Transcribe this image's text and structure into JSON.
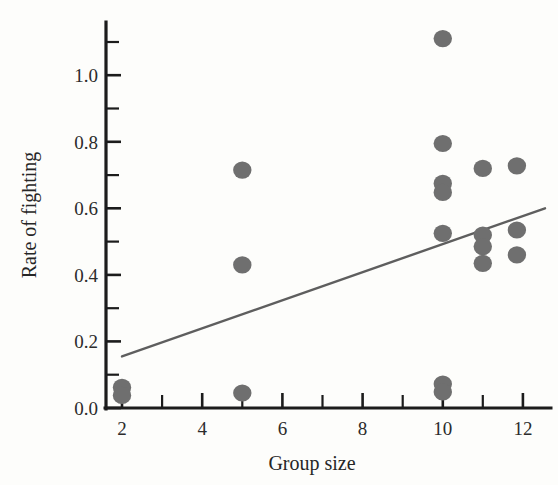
{
  "chart_data": {
    "type": "scatter",
    "title": "",
    "subtitle": "",
    "xlabel": "Group size",
    "ylabel": "Rate of fighting",
    "xlim": [
      1.6,
      12.7
    ],
    "ylim": [
      0.0,
      1.16
    ],
    "xticks": [
      2,
      4,
      6,
      8,
      10,
      12
    ],
    "xtick_labels": [
      "2",
      "4",
      "6",
      "8",
      "10",
      "12"
    ],
    "xminorticks": [
      3,
      5,
      7,
      9,
      11
    ],
    "yticks": [
      0.0,
      0.2,
      0.4,
      0.6,
      0.8,
      1.0
    ],
    "ytick_labels": [
      "0.0",
      "0.2",
      "0.4",
      "0.6",
      "0.8",
      "1.0"
    ],
    "yminorticks": [
      0.1,
      0.3,
      0.5,
      0.7,
      0.9,
      1.1
    ],
    "grid": false,
    "legend": false,
    "marker_color": "#6f6f6f",
    "axis_color": "#1c1c1c",
    "trendline_color": "#5e5e5e",
    "background": "#fdfdfb",
    "points": [
      {
        "x": 2,
        "y": 0.062
      },
      {
        "x": 2,
        "y": 0.038
      },
      {
        "x": 5,
        "y": 0.715
      },
      {
        "x": 5,
        "y": 0.43
      },
      {
        "x": 5,
        "y": 0.045
      },
      {
        "x": 10,
        "y": 1.11
      },
      {
        "x": 10,
        "y": 0.795
      },
      {
        "x": 10,
        "y": 0.675
      },
      {
        "x": 10,
        "y": 0.648
      },
      {
        "x": 10,
        "y": 0.525
      },
      {
        "x": 10,
        "y": 0.072
      },
      {
        "x": 10,
        "y": 0.048
      },
      {
        "x": 11,
        "y": 0.72
      },
      {
        "x": 11,
        "y": 0.52
      },
      {
        "x": 11,
        "y": 0.485
      },
      {
        "x": 11,
        "y": 0.435
      },
      {
        "x": 11.85,
        "y": 0.728
      },
      {
        "x": 11.85,
        "y": 0.535
      },
      {
        "x": 11.85,
        "y": 0.46
      }
    ],
    "trendline": {
      "x": [
        2.0,
        12.55
      ],
      "y": [
        0.155,
        0.6
      ],
      "slope": 0.0422,
      "intercept": 0.0706
    }
  },
  "axes": {
    "x_title": "Group size",
    "y_title": "Rate of fighting"
  }
}
